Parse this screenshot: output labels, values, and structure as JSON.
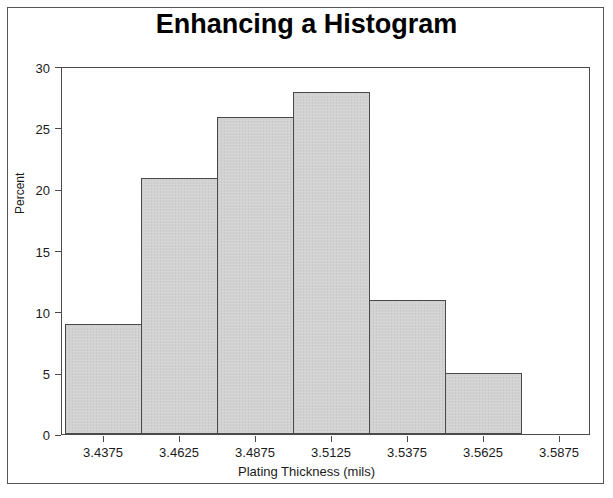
{
  "frame": {
    "border_color": "#555555",
    "background": "#ffffff"
  },
  "chart_data": {
    "type": "bar",
    "title": "Enhancing a Histogram",
    "xlabel": "Plating Thickness (mils)",
    "ylabel": "Percent",
    "categories": [
      "3.4375",
      "3.4625",
      "3.4875",
      "3.5125",
      "3.5375",
      "3.5625",
      "3.5875"
    ],
    "values": [
      9,
      21,
      26,
      28,
      11,
      5,
      0
    ],
    "xtick_labels": [
      "3.4375",
      "3.4625",
      "3.4875",
      "3.5125",
      "3.5375",
      "3.5625",
      "3.5875"
    ],
    "ytick_labels": [
      "0",
      "5",
      "10",
      "15",
      "20",
      "25",
      "30"
    ],
    "ytick_values": [
      0,
      5,
      10,
      15,
      20,
      25,
      30
    ],
    "ylim": [
      0,
      30
    ],
    "grid": false,
    "legend": false,
    "bar_fill_color": "#d2d2d2",
    "bar_border_color": "#4a4a4a",
    "axis_color": "#4a4a4a",
    "text_color": "#1a1a1a",
    "bin_width_label": "0.025",
    "bar_count": 6
  }
}
